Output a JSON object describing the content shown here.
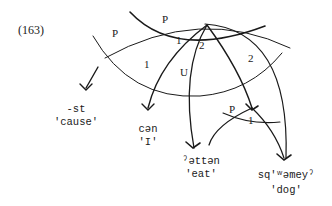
{
  "example_number": "(163)",
  "arc_labels": {
    "p_left": "P",
    "p_top": "P",
    "one_left": "1",
    "one_top": "1",
    "two_top": "2",
    "u": "U",
    "two_right": "2",
    "p_lower": "P",
    "one_lower": "1"
  },
  "nodes": [
    {
      "form": "-st",
      "gloss": "'cause'"
    },
    {
      "form": "cən",
      "gloss": "'I'"
    },
    {
      "form": "ˀəttən",
      "gloss": "'eat'"
    },
    {
      "form": "sq'ʷəmeyˀ",
      "gloss": "'dog'"
    }
  ],
  "colors": {
    "ink": "#1a1a1a",
    "background": "#ffffff"
  }
}
